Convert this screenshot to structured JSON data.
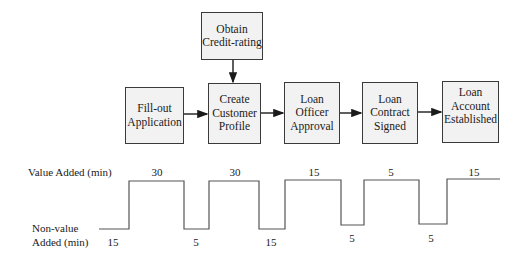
{
  "diagram": {
    "boxes": [
      {
        "id": "obtain",
        "label": "Obtain\nCredit-rating"
      },
      {
        "id": "fillout",
        "label": "Fill-out\nApplication"
      },
      {
        "id": "create",
        "label": "Create\nCustomer\nProfile"
      },
      {
        "id": "officer",
        "label": "Loan\nOfficer\nApproval"
      },
      {
        "id": "contract",
        "label": "Loan\nContract\nSigned"
      },
      {
        "id": "account",
        "label": "Loan\nAccount\nEstablished"
      }
    ],
    "edges": [
      {
        "from": "obtain",
        "to": "create"
      },
      {
        "from": "fillout",
        "to": "create"
      },
      {
        "from": "create",
        "to": "officer"
      },
      {
        "from": "officer",
        "to": "contract"
      },
      {
        "from": "contract",
        "to": "account"
      }
    ]
  },
  "timeline": {
    "value_added_label": "Value Added (min)",
    "non_value_label_line1": "Non-value",
    "non_value_label_line2": "Added (min)",
    "value_added": [
      "30",
      "30",
      "15",
      "5",
      "15"
    ],
    "non_value_added": [
      "15",
      "5",
      "15",
      "5",
      "5"
    ]
  }
}
